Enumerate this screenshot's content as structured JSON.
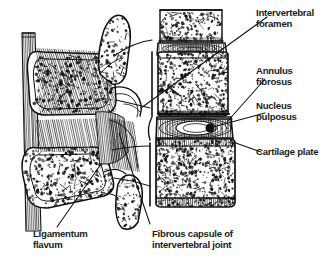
{
  "figure": {
    "background_color": "#ffffff",
    "ink_color": "#111111",
    "width": 324,
    "height": 267
  },
  "labels": {
    "intervertebral_foramen": "Intervertebral\nforamen",
    "annulus_fibrosus": "Annulus\nfibrosus",
    "nucleus_pulposus": "Nucleus\npulposus",
    "cartilage_plate": "Cartilage plate",
    "ligamentum_flavum": "Ligamentum\nflavum",
    "fibrous_capsule": "Fibrous capsule of\nintervertebral joint"
  },
  "anatomy": {
    "structures": [
      "supraspinous-ligament",
      "spinous-process-upper",
      "spinous-process-lower",
      "superior-articular-process",
      "inferior-articular-process",
      "facet-joint",
      "vertebral-body-upper",
      "vertebral-body-middle",
      "vertebral-body-lower",
      "intervertebral-disc-upper",
      "intervertebral-disc-lower",
      "cartilage-end-plate",
      "ligamentum-flavum",
      "interspinous-ligament"
    ],
    "textures": {
      "trabecular_bone": "stipple",
      "ligament": "parallel-hatching",
      "annulus": "concentric-lamellae"
    }
  },
  "leaders": [
    {
      "name": "leader-intervertebral-foramen",
      "from": [
        268,
        18
      ],
      "to": [
        140,
        108
      ]
    },
    {
      "name": "leader-annulus-fibrosus",
      "from": [
        266,
        78
      ],
      "to": [
        228,
        122
      ]
    },
    {
      "name": "leader-nucleus-pulposus",
      "from": [
        266,
        112
      ],
      "to": [
        212,
        127
      ]
    },
    {
      "name": "leader-cartilage-plate",
      "from": [
        262,
        152
      ],
      "to": [
        232,
        142
      ]
    },
    {
      "name": "leader-ligamentum-flavum",
      "from": [
        56,
        228
      ],
      "to": [
        100,
        165
      ]
    },
    {
      "name": "leader-fibrous-capsule",
      "from": [
        150,
        225
      ],
      "to": [
        118,
        132
      ]
    }
  ]
}
